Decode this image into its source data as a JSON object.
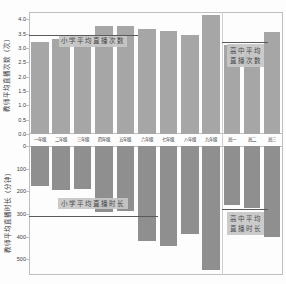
{
  "figure": {
    "background": "#fdfdfd",
    "frame_color": "#bfbfbf",
    "divider_color": "#cfcfcf",
    "top_bar_color": "#a6a6a6",
    "bottom_bar_color": "#8f8f8f",
    "ref_line_color": "#5a5a5a",
    "annotation_bg": "#c7c7c7",
    "text_color": "#3c3c3c"
  },
  "categories": [
    "一年级",
    "二年级",
    "三年级",
    "四年级",
    "五年级",
    "六年级",
    "七年级",
    "八年级",
    "九年级",
    "高一",
    "高二",
    "高三"
  ],
  "chart_data": [
    {
      "type": "bar",
      "panel": "top",
      "ylabel": "教师平均直播次数（次）",
      "ytick_values": [
        0,
        0.5,
        1.0,
        1.5,
        2.0,
        2.5,
        3.0,
        3.5,
        4.0
      ],
      "ytick_labels": [
        "0.0",
        "0.5",
        "1.0",
        "1.5",
        "2.0",
        "2.5",
        "3.0",
        "3.5",
        "4.0"
      ],
      "ylim": [
        0,
        4.25
      ],
      "categories": [
        "一年级",
        "二年级",
        "三年级",
        "四年级",
        "五年级",
        "六年级",
        "七年级",
        "八年级",
        "九年级",
        "高一",
        "高二",
        "高三"
      ],
      "values": [
        3.2,
        3.3,
        3.3,
        3.75,
        3.75,
        3.65,
        3.6,
        3.45,
        4.15,
        3.1,
        2.95,
        3.55
      ],
      "annotations": [
        {
          "lines": [
            "小学平均直播次数"
          ],
          "value": 3.45,
          "group": "primary"
        },
        {
          "lines": [
            "高中平均",
            "直播次数"
          ],
          "value": 3.2,
          "group": "senior"
        }
      ]
    },
    {
      "type": "bar",
      "panel": "bottom",
      "inverted": true,
      "ylabel": "教师平均直播时长（分钟）",
      "ytick_values": [
        0,
        100,
        200,
        300,
        400,
        500
      ],
      "ytick_labels": [
        "0",
        "100",
        "200",
        "300",
        "400",
        "500"
      ],
      "ylim": [
        0,
        570
      ],
      "categories": [
        "一年级",
        "二年级",
        "三年级",
        "四年级",
        "五年级",
        "六年级",
        "七年级",
        "八年级",
        "九年级",
        "高一",
        "高二",
        "高三"
      ],
      "values": [
        175,
        195,
        190,
        290,
        285,
        420,
        440,
        390,
        550,
        260,
        275,
        400
      ],
      "annotations": [
        {
          "lines": [
            "小学平均直播时长"
          ],
          "value": 310,
          "group": "primary"
        },
        {
          "lines": [
            "高中平均",
            "直播时长"
          ],
          "value": 280,
          "group": "senior"
        }
      ]
    }
  ]
}
